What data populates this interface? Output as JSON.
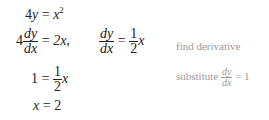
{
  "lines": [
    {
      "lhs_coef": "4",
      "lhs_var": "y",
      "eq": "=",
      "rhs_var": "x",
      "rhs_exp": "2"
    },
    {
      "coef": "4",
      "num": "dy",
      "den": "dx",
      "eq": "=",
      "rhs": "2x,",
      "num2": "dy",
      "den2": "dx",
      "eq2": "=",
      "half_num": "1",
      "half_den": "2",
      "rhs_var": "x",
      "note": "find derivative"
    },
    {
      "lhs": "1",
      "eq": "=",
      "half_num": "1",
      "half_den": "2",
      "rhs_var": "x",
      "note_prefix": "substitute",
      "note_num": "dy",
      "note_den": "dx",
      "note_suffix": "= 1"
    },
    {
      "lhs": "x",
      "eq": "=",
      "rhs": "2"
    }
  ]
}
